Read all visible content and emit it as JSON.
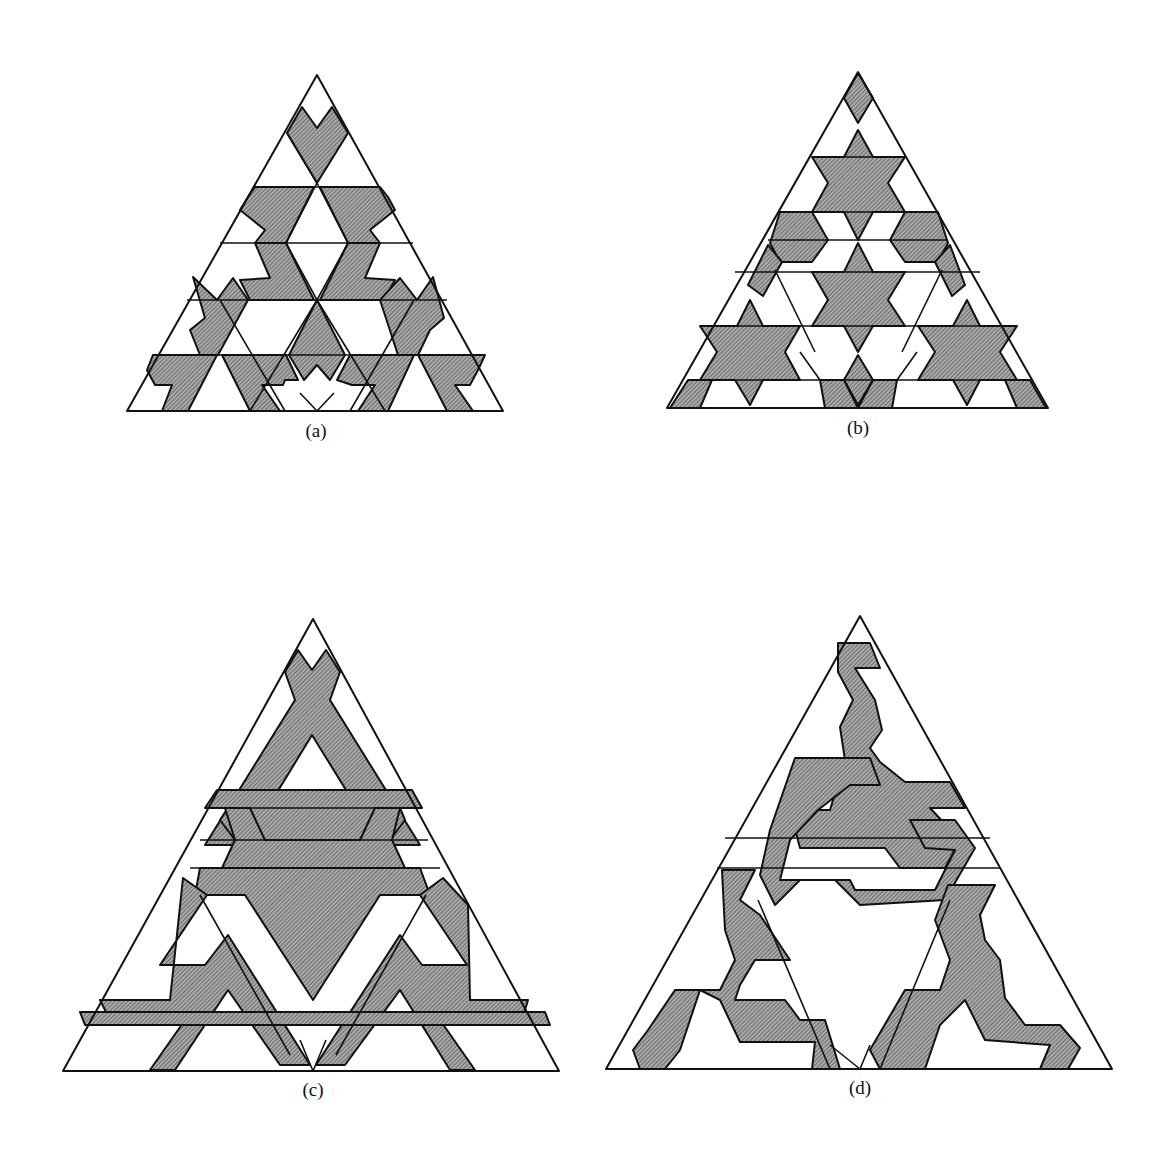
{
  "figure": {
    "panels": [
      {
        "id": "a",
        "label": "(a)",
        "description": "Triangular tiling with shaded band pattern, variant a"
      },
      {
        "id": "b",
        "label": "(b)",
        "description": "Triangular tiling with shaded six-pointed star pattern"
      },
      {
        "id": "c",
        "label": "(c)",
        "description": "Triangular tiling with shaded interlaced triangular band pattern"
      },
      {
        "id": "d",
        "label": "(d)",
        "description": "Triangular tiling with shaded zig-zag band pattern"
      }
    ],
    "colors": {
      "shade": "#8c8c8c",
      "line": "#111111",
      "background": "#ffffff"
    }
  }
}
